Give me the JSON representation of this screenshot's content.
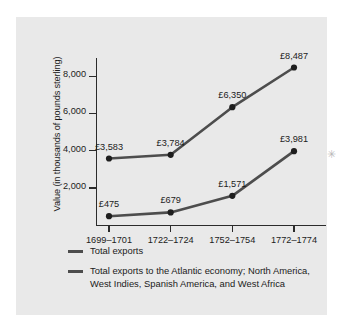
{
  "chart_data": {
    "type": "line",
    "title": "",
    "xlabel": "",
    "ylabel": "Value (in thousands of pounds sterling)",
    "categories": [
      "1699–1701",
      "1722–1724",
      "1752–1754",
      "1772–1774"
    ],
    "ylim": [
      0,
      9000
    ],
    "yticks": [
      2000,
      4000,
      6000,
      8000
    ],
    "ytick_labels": [
      "2,000",
      "4,000",
      "6,000",
      "8,000"
    ],
    "grid": false,
    "legend_position": "below-axes",
    "series": [
      {
        "name": "Total exports",
        "values": [
          3583,
          3784,
          6350,
          8487
        ],
        "labels": [
          "£3,583",
          "£3,784",
          "£6,350",
          "£8,487"
        ],
        "color": "#4d4d4d"
      },
      {
        "name": "Total exports to the Atlantic economy; North America, West Indies, Spanish America, and West Africa",
        "values": [
          475,
          679,
          1571,
          3981
        ],
        "labels": [
          "£475",
          "£679",
          "£1,571",
          "£3,981"
        ],
        "color": "#4d4d4d"
      }
    ]
  },
  "legend": {
    "items": [
      {
        "label": "Total exports"
      },
      {
        "label": "Total exports to the Atlantic economy;\nNorth America, West Indies, Spanish America,\nand West Africa"
      }
    ]
  },
  "marks": {
    "page_mark": "✳"
  },
  "colors": {
    "panel_background": "#e9e9e9",
    "page_background": "#ffffff",
    "axis": "#2b2b2b",
    "line": "#4d4d4d",
    "marker": "#1e1e1e",
    "text": "#1b1b1b"
  }
}
